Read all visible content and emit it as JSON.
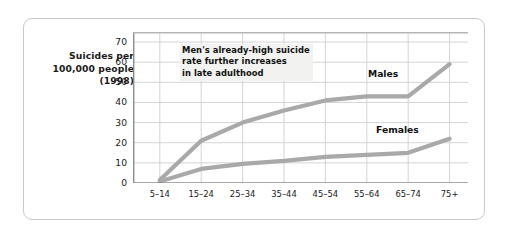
{
  "chart_data": {
    "type": "line",
    "title": "",
    "xlabel": "Age, in years",
    "ylabel": "Suicides per 100,000 people (1998)",
    "ylabel_lines": [
      "Suicides per",
      "100,000 people",
      "(1998)"
    ],
    "categories": [
      "5–14",
      "15–24",
      "25–34",
      "35–44",
      "45–54",
      "55–64",
      "65–74",
      "75+"
    ],
    "yticks": [
      0,
      10,
      20,
      30,
      40,
      50,
      60,
      70
    ],
    "ylim": [
      0,
      75
    ],
    "grid": true,
    "legend_position": "inline-labels",
    "series": [
      {
        "name": "Males",
        "color": "#a9a9a9",
        "values": [
          1.5,
          21,
          30,
          36,
          41,
          43,
          43,
          59
        ]
      },
      {
        "name": "Females",
        "color": "#a9a9a9",
        "values": [
          0.8,
          7,
          9.5,
          11,
          13,
          14,
          15,
          22
        ]
      }
    ],
    "annotations": [
      {
        "id": "males-late-adulthood-note",
        "lines": [
          "Men's already-high suicide",
          "rate further increases",
          "in late adulthood"
        ]
      }
    ]
  },
  "colors": {
    "line": "#a9a9a9",
    "grid": "#cfcfcf",
    "axis": "#8c8c8c",
    "frame": "#c9c9c9",
    "text": "#1a1a1a",
    "annotation_bg": "#f2f2f0"
  }
}
